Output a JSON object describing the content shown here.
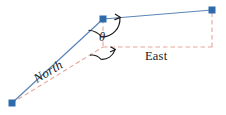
{
  "figure": {
    "background_color": "#ffffff",
    "width": 226,
    "height": 115,
    "colors": {
      "vector_blue": "#5b86b8",
      "marker_blue": "#2f6aad",
      "component_red": "#e8a49c",
      "annotation_black": "#1a1a1a"
    },
    "labels": {
      "north": "North",
      "east": "East",
      "theta": "θ"
    },
    "points": [
      {
        "name": "origin-point",
        "x": 12,
        "y": 103
      },
      {
        "name": "vertex-point",
        "x": 103,
        "y": 19
      },
      {
        "name": "terminal-point",
        "x": 212,
        "y": 10
      }
    ],
    "solid_segments": [
      {
        "name": "leg-origin-to-vertex",
        "x1": 12,
        "y1": 103,
        "x2": 103,
        "y2": 19
      },
      {
        "name": "leg-vertex-to-terminal",
        "x1": 103,
        "y1": 19,
        "x2": 212,
        "y2": 10
      }
    ],
    "dashed_segments": [
      {
        "name": "north-component",
        "x1": 12,
        "y1": 103,
        "x2": 103,
        "y2": 47
      },
      {
        "name": "vertical-drop-at-vertex",
        "x1": 103,
        "y1": 19,
        "x2": 103,
        "y2": 47
      },
      {
        "name": "east-component",
        "x1": 103,
        "y1": 47,
        "x2": 212,
        "y2": 47
      },
      {
        "name": "vertical-drop-at-terminal",
        "x1": 212,
        "y1": 47,
        "x2": 212,
        "y2": 10
      }
    ],
    "angle_arcs": [
      {
        "name": "upper-angle-arc",
        "center_x": 103,
        "center_y": 19,
        "radius": 18
      },
      {
        "name": "lower-angle-arc",
        "center_x": 103,
        "center_y": 47,
        "radius": 13
      }
    ]
  }
}
